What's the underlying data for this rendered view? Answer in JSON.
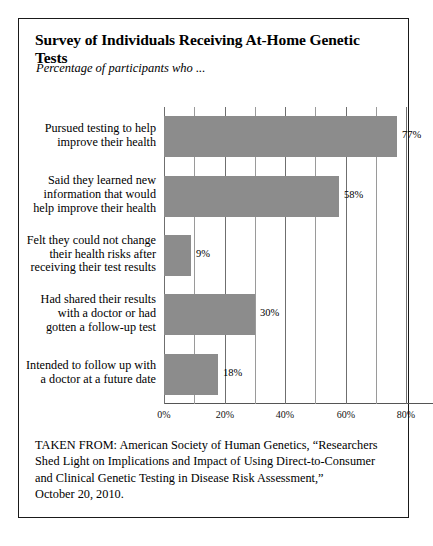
{
  "title": "Survey of Individuals Receiving At-Home Genetic Tests",
  "subtitle": "Percentage of participants who ...",
  "chart_data": {
    "type": "bar",
    "orientation": "horizontal",
    "title": "Survey of Individuals Receiving At-Home Genetic Tests",
    "subtitle": "Percentage of participants who ...",
    "xlabel": "",
    "ylabel": "",
    "xlim": [
      0,
      80
    ],
    "grid": true,
    "legend": false,
    "categories": [
      "Pursued testing to help improve their health",
      "Said they learned new information that would help improve their health",
      "Felt they could not change their health risks after receiving their test results",
      "Had shared their results with a doctor or had gotten a follow-up test",
      "Intended to follow up with a doctor at a future date"
    ],
    "category_lines": [
      [
        "Pursued testing to help",
        "improve their health"
      ],
      [
        "Said they learned new",
        "information that would",
        "help improve their health"
      ],
      [
        "Felt they could not change",
        "their health risks after",
        "receiving their test results"
      ],
      [
        "Had shared their results",
        "with a doctor or had",
        "gotten a follow-up test"
      ],
      [
        "Intended to follow up with",
        "a doctor at a future date"
      ]
    ],
    "values": [
      77,
      58,
      9,
      30,
      18
    ],
    "value_labels": [
      "77%",
      "58%",
      "9%",
      "30%",
      "18%"
    ],
    "tick_values": [
      0,
      20,
      40,
      60,
      80
    ],
    "tick_labels": [
      "0%",
      "20%",
      "40%",
      "60%",
      "80%"
    ],
    "minor_tick_step": 10,
    "bar_color": "#8c8c8c",
    "grid_color": "#9a9a9a"
  },
  "footer": {
    "lines": [
      "TAKEN FROM: American Society of Human Genetics, “Researchers",
      "Shed Light on Implications and Impact of Using Direct-to-Consumer",
      "and Clinical Genetic Testing in Disease Risk Assessment,”",
      "October 20, 2010."
    ]
  }
}
